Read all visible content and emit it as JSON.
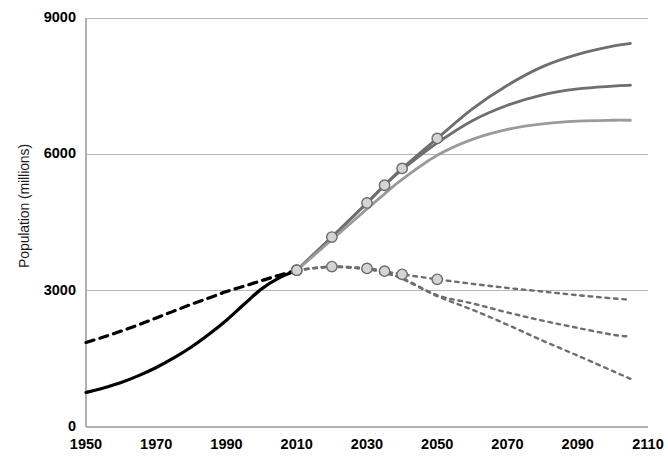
{
  "chart_data": {
    "type": "line",
    "title": "",
    "xlabel": "",
    "ylabel": "Population (millions)",
    "xlim": [
      1950,
      2110
    ],
    "ylim": [
      0,
      9000
    ],
    "xticks": [
      1950,
      1970,
      1990,
      2010,
      2030,
      2050,
      2070,
      2090,
      2110
    ],
    "yticks": [
      0,
      3000,
      6000,
      9000
    ],
    "grid": "horizontal",
    "legend": "none",
    "branch_year": 2010,
    "branch_value": 3450,
    "series": [
      {
        "name": "historical-solid-black",
        "style": "solid",
        "color": "#000000",
        "width": 3.2,
        "markers": false,
        "x": [
          1950,
          1955,
          1960,
          1965,
          1970,
          1975,
          1980,
          1985,
          1990,
          1995,
          2000,
          2005,
          2010
        ],
        "y": [
          760,
          860,
          980,
          1130,
          1310,
          1520,
          1760,
          2040,
          2350,
          2700,
          3040,
          3280,
          3450
        ]
      },
      {
        "name": "historical-dashed-black",
        "style": "dashed",
        "color": "#000000",
        "width": 3.2,
        "markers": false,
        "x": [
          1950,
          1955,
          1960,
          1965,
          1970,
          1975,
          1980,
          1985,
          1990,
          1995,
          2000,
          2005,
          2010
        ],
        "y": [
          1860,
          1980,
          2110,
          2250,
          2400,
          2550,
          2700,
          2840,
          2980,
          3100,
          3220,
          3340,
          3450
        ]
      },
      {
        "name": "upper-projection-high",
        "style": "solid",
        "color": "#6e6e6e",
        "width": 2.8,
        "markers": true,
        "marker_x": [
          2010,
          2020,
          2030,
          2035,
          2040,
          2050
        ],
        "x": [
          2010,
          2020,
          2030,
          2035,
          2040,
          2050,
          2060,
          2070,
          2080,
          2090,
          2100,
          2105
        ],
        "y": [
          3450,
          4180,
          4930,
          5320,
          5690,
          6350,
          7000,
          7520,
          7930,
          8200,
          8380,
          8440
        ]
      },
      {
        "name": "upper-projection-medium",
        "style": "solid",
        "color": "#6e6e6e",
        "width": 2.8,
        "markers": false,
        "x": [
          2010,
          2020,
          2030,
          2035,
          2040,
          2050,
          2060,
          2070,
          2080,
          2090,
          2100,
          2105
        ],
        "y": [
          3450,
          4180,
          4930,
          5320,
          5660,
          6250,
          6740,
          7080,
          7310,
          7440,
          7500,
          7520
        ]
      },
      {
        "name": "upper-projection-low",
        "style": "solid",
        "color": "#9a9a9a",
        "width": 2.8,
        "markers": false,
        "x": [
          2010,
          2020,
          2030,
          2035,
          2040,
          2050,
          2060,
          2070,
          2080,
          2090,
          2100,
          2105
        ],
        "y": [
          3450,
          4120,
          4800,
          5130,
          5450,
          5980,
          6330,
          6550,
          6670,
          6730,
          6750,
          6750
        ]
      },
      {
        "name": "lower-projection-high",
        "style": "dotted",
        "color": "#6e6e6e",
        "width": 2.4,
        "markers": true,
        "marker_x": [
          2010,
          2020,
          2030,
          2035,
          2040,
          2050
        ],
        "x": [
          2010,
          2020,
          2030,
          2035,
          2040,
          2050,
          2060,
          2070,
          2080,
          2090,
          2100,
          2105
        ],
        "y": [
          3450,
          3530,
          3490,
          3430,
          3360,
          3250,
          3150,
          3060,
          2980,
          2900,
          2830,
          2800
        ]
      },
      {
        "name": "lower-projection-medium",
        "style": "dotted",
        "color": "#6e6e6e",
        "width": 2.4,
        "markers": false,
        "x": [
          2010,
          2020,
          2030,
          2035,
          2040,
          2050,
          2060,
          2070,
          2080,
          2090,
          2100,
          2105
        ],
        "y": [
          3450,
          3530,
          3480,
          3400,
          3280,
          2900,
          2720,
          2520,
          2340,
          2180,
          2030,
          1990
        ]
      },
      {
        "name": "lower-projection-low",
        "style": "dotted",
        "color": "#6e6e6e",
        "width": 2.4,
        "markers": false,
        "x": [
          2010,
          2020,
          2030,
          2035,
          2040,
          2050,
          2060,
          2070,
          2080,
          2090,
          2100,
          2105
        ],
        "y": [
          3450,
          3520,
          3470,
          3390,
          3260,
          2880,
          2580,
          2250,
          1900,
          1570,
          1230,
          1060
        ]
      }
    ],
    "marker_style": {
      "shape": "circle",
      "fill": "#d4d4d4",
      "stroke": "#6b6b6b",
      "radius": 5.2
    },
    "colors": {
      "grid": "#b5b5b5",
      "axis": "#b0b0b0",
      "text": "#111111",
      "historical": "#000000",
      "projection_dark": "#6e6e6e",
      "projection_light": "#9a9a9a"
    }
  },
  "axis": {
    "y_title": "Population (millions)",
    "y_ticks": [
      "9000",
      "6000",
      "3000",
      "0"
    ],
    "x_ticks": [
      "1950",
      "1970",
      "1990",
      "2010",
      "2030",
      "2050",
      "2070",
      "2090",
      "2110"
    ]
  }
}
